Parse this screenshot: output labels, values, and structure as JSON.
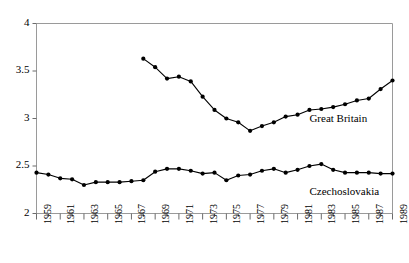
{
  "chart_data": {
    "type": "line",
    "title": "",
    "xlabel": "",
    "ylabel": "",
    "xlim": [
      1959,
      1989
    ],
    "ylim": [
      2,
      4
    ],
    "yticks": [
      2,
      2.5,
      3,
      3.5,
      4
    ],
    "ytick_labels": [
      "2",
      "2.5",
      "3",
      "3.5",
      "4"
    ],
    "xticks": [
      1959,
      1960,
      1961,
      1962,
      1963,
      1964,
      1965,
      1966,
      1967,
      1968,
      1969,
      1970,
      1971,
      1972,
      1973,
      1974,
      1975,
      1976,
      1977,
      1978,
      1979,
      1980,
      1981,
      1982,
      1983,
      1984,
      1985,
      1986,
      1987,
      1988,
      1989
    ],
    "xtick_labels_shown": [
      "1959",
      "1961",
      "1963",
      "1965",
      "1967",
      "1969",
      "1971",
      "1973",
      "1975",
      "1977",
      "1979",
      "1981",
      "1983",
      "1985",
      "1987",
      "1989"
    ],
    "xtick_label_rotation": -90,
    "grid": false,
    "legend_position": "inline-annotation",
    "marker": "filled-circle",
    "line_color": "#000000",
    "series": [
      {
        "name": "Great Britain",
        "x": [
          1968,
          1969,
          1970,
          1971,
          1972,
          1973,
          1974,
          1975,
          1976,
          1977,
          1978,
          1979,
          1980,
          1981,
          1982,
          1983,
          1984,
          1985,
          1986,
          1987,
          1988,
          1989
        ],
        "values": [
          3.63,
          3.54,
          3.42,
          3.44,
          3.39,
          3.23,
          3.09,
          3.0,
          2.96,
          2.87,
          2.92,
          2.96,
          3.02,
          3.04,
          3.09,
          3.1,
          3.12,
          3.15,
          3.19,
          3.21,
          3.31,
          3.4
        ]
      },
      {
        "name": "Czechoslovakia",
        "x": [
          1959,
          1960,
          1961,
          1962,
          1963,
          1964,
          1965,
          1966,
          1967,
          1968,
          1969,
          1970,
          1971,
          1972,
          1973,
          1974,
          1975,
          1976,
          1977,
          1978,
          1979,
          1980,
          1981,
          1982,
          1983,
          1984,
          1985,
          1986,
          1987,
          1988,
          1989
        ],
        "values": [
          2.43,
          2.41,
          2.37,
          2.36,
          2.3,
          2.33,
          2.33,
          2.33,
          2.34,
          2.35,
          2.44,
          2.47,
          2.47,
          2.45,
          2.42,
          2.43,
          2.35,
          2.4,
          2.41,
          2.45,
          2.47,
          2.43,
          2.46,
          2.5,
          2.52,
          2.46,
          2.43,
          2.43,
          2.43,
          2.42,
          2.42
        ]
      }
    ],
    "annotations": [
      {
        "text": "Great Britain",
        "x": 1982,
        "y": 2.98
      },
      {
        "text": "Czechoslovakia",
        "x": 1982,
        "y": 2.22
      }
    ]
  }
}
